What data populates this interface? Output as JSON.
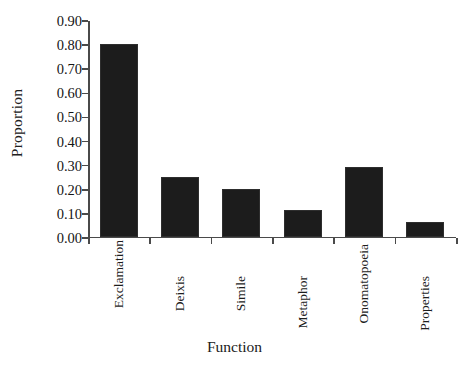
{
  "chart_data": {
    "type": "bar",
    "title": "",
    "xlabel": "Function",
    "ylabel": "Proportion",
    "categories": [
      "Exclamation",
      "Deixis",
      "Simile",
      "Metaphor",
      "Onomatopoeia",
      "Properties"
    ],
    "values": [
      0.8,
      0.245,
      0.197,
      0.108,
      0.29,
      0.062
    ],
    "ylim": [
      0.0,
      0.9
    ],
    "ytick_step": 0.1,
    "ytick_labels": [
      "0.00",
      "0.10",
      "0.20",
      "0.30",
      "0.40",
      "0.50",
      "0.60",
      "0.70",
      "0.80",
      "0.90"
    ],
    "ytick_values": [
      0.0,
      0.1,
      0.2,
      0.3,
      0.4,
      0.5,
      0.6,
      0.7,
      0.8,
      0.9
    ],
    "grid": false,
    "legend": null,
    "bar_color": "#1c1c1c",
    "axis_color": "#4a4a4a",
    "background_color": "#ffffff",
    "series": [
      {
        "name": "Proportion",
        "values": [
          0.8,
          0.245,
          0.197,
          0.108,
          0.29,
          0.062
        ]
      }
    ],
    "label_rotation_deg": 90,
    "label_stagger_offsets_px": [
      0,
      36,
      36,
      36,
      4,
      36
    ]
  }
}
